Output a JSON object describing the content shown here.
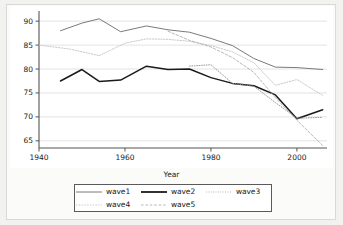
{
  "chart_data": {
    "type": "line",
    "title": "",
    "subtitle": "",
    "xlabel": "Year",
    "ylabel": "",
    "xlim": [
      1940,
      2007
    ],
    "ylim": [
      63.5,
      91.5
    ],
    "xticks": [
      1940,
      1960,
      1980,
      2000
    ],
    "yticks": [
      65,
      70,
      75,
      80,
      85,
      90
    ],
    "grid": "horizontal",
    "legend_position": "below-center",
    "series": [
      {
        "name": "wave1",
        "style": "solid",
        "color": "#6b6b6b",
        "width": 0.9,
        "x": [
          1945,
          1950,
          1954,
          1959,
          1965,
          1970,
          1975,
          1980,
          1985,
          1990,
          1995,
          2000,
          2006
        ],
        "y": [
          88.0,
          89.6,
          90.5,
          87.8,
          89.0,
          88.2,
          87.7,
          86.4,
          84.9,
          82.2,
          80.4,
          80.3,
          79.9
        ]
      },
      {
        "name": "wave2",
        "style": "solid",
        "color": "#1a1a1a",
        "width": 1.5,
        "x": [
          1945,
          1950,
          1954,
          1959,
          1965,
          1970,
          1975,
          1980,
          1985,
          1990,
          1995,
          2000,
          2006
        ],
        "y": [
          77.5,
          79.9,
          77.4,
          77.7,
          80.6,
          79.9,
          80.0,
          78.2,
          77.0,
          76.5,
          74.6,
          69.6,
          71.5
        ]
      },
      {
        "name": "wave3",
        "style": "dotted",
        "color": "#8f8f8f",
        "width": 0.9,
        "x": [
          1975,
          1980,
          1985,
          1990,
          1995,
          2000,
          2006
        ],
        "y": [
          80.6,
          80.9,
          77.0,
          76.4,
          73.0,
          69.7,
          69.9
        ]
      },
      {
        "name": "wave4",
        "style": "dotted-light",
        "color": "#c4c4c4",
        "width": 0.9,
        "x": [
          1940,
          1947,
          1954,
          1960,
          1965,
          1970,
          1975,
          1980,
          1985,
          1990,
          1995,
          2000,
          2006
        ],
        "y": [
          85.0,
          84.2,
          82.8,
          85.4,
          86.3,
          86.2,
          85.8,
          84.9,
          83.6,
          81.3,
          76.6,
          77.8,
          74.5
        ]
      },
      {
        "name": "wave5",
        "style": "dashed",
        "color": "#b0b0b0",
        "width": 0.9,
        "x": [
          1970,
          1975,
          1980,
          1985,
          1990,
          1995,
          2000,
          2006
        ],
        "y": [
          87.9,
          86.0,
          84.6,
          82.4,
          79.3,
          74.0,
          69.3,
          64.0
        ]
      }
    ]
  },
  "axes": {
    "x_tick_labels": [
      "1940",
      "1960",
      "1980",
      "2000"
    ],
    "y_tick_labels": [
      "90",
      "85",
      "80",
      "75",
      "70",
      "65"
    ],
    "x_axis_title": "Year"
  },
  "legend": {
    "row1": [
      {
        "label": "wave1",
        "style": "solid",
        "color": "#6b6b6b",
        "width": 0.9
      },
      {
        "label": "wave2",
        "style": "solid",
        "color": "#1a1a1a",
        "width": 1.8
      },
      {
        "label": "wave3",
        "style": "dotted",
        "color": "#9a9a9a",
        "width": 0.9
      }
    ],
    "row2": [
      {
        "label": "wave4",
        "style": "dotted-light",
        "color": "#c4c4c4",
        "width": 0.9
      },
      {
        "label": "wave5",
        "style": "dashed",
        "color": "#b0b0b0",
        "width": 0.9
      }
    ]
  }
}
